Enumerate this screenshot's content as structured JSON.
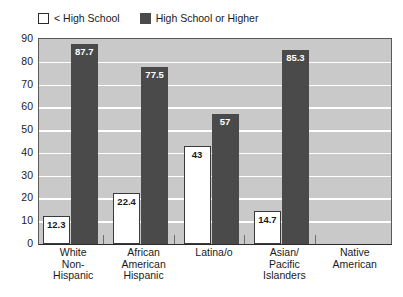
{
  "legend": {
    "position": "top-left",
    "entries": [
      {
        "label": "< High School",
        "swatch": "light",
        "color": "#ffffff"
      },
      {
        "label": "High School or Higher",
        "swatch": "dark",
        "color": "#4a4a4a"
      }
    ]
  },
  "colors": {
    "plot_background": "#c9c9c9",
    "gridline": "#ffffff",
    "series_less_than_high_school": "#ffffff",
    "series_high_school_or_higher": "#4a4a4a",
    "axis": "#2b2b2b",
    "text": "#1a1a1a"
  },
  "chart_data": {
    "type": "bar",
    "title": "",
    "xlabel": "",
    "ylabel": "",
    "ylim": [
      0,
      90
    ],
    "ytick_step": 10,
    "yticks": [
      "90",
      "80",
      "70",
      "60",
      "50",
      "40",
      "30",
      "20",
      "10",
      "0"
    ],
    "grid": true,
    "legend_position": "top-left",
    "categories": [
      "White Non-Hispanic",
      "African American Hispanic",
      "Latina/o",
      "Asian/ Pacific Islanders",
      "Native American"
    ],
    "category_lines": [
      [
        "White",
        "Non-",
        "Hispanic"
      ],
      [
        "African",
        "American",
        "Hispanic"
      ],
      [
        "Latina/o"
      ],
      [
        "Asian/",
        "Pacific",
        "Islanders"
      ],
      [
        "Native",
        "American"
      ]
    ],
    "series": [
      {
        "name": "< High School",
        "values": [
          12.3,
          22.4,
          43,
          14.7,
          null
        ],
        "labels": [
          "12.3",
          "22.4",
          "43",
          "14.7",
          ""
        ]
      },
      {
        "name": "High School or Higher",
        "values": [
          87.7,
          77.5,
          57,
          85.3,
          null
        ],
        "labels": [
          "87.7",
          "77.5",
          "57",
          "85.3",
          ""
        ]
      }
    ]
  }
}
